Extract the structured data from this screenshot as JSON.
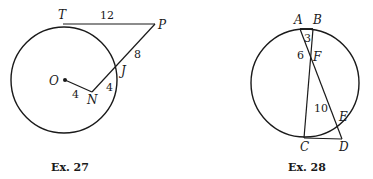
{
  "figures": [
    {
      "caption": "Ex. 27",
      "points": {
        "T": "T",
        "P": "P",
        "J": "J",
        "O": "O",
        "N": "N"
      },
      "lengths": {
        "TP": "12",
        "PJ": "8",
        "JN": "4",
        "ON": "4"
      }
    },
    {
      "caption": "Ex. 28",
      "points": {
        "A": "A",
        "B": "B",
        "F": "F",
        "C": "C",
        "D": "D",
        "E": "E"
      },
      "lengths": {
        "BF": "3",
        "AF": "6",
        "FE": "10"
      }
    }
  ],
  "colors": {
    "stroke": "#1a1a1a",
    "background": "#ffffff"
  }
}
